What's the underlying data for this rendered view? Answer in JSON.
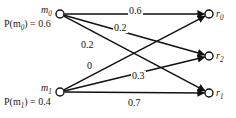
{
  "figure": {
    "type": "bipartite-channel-diagram",
    "ink_color": "#111111",
    "background": "#ffffff"
  },
  "inputs": [
    {
      "id": "m0",
      "label": "m",
      "subscript": "0",
      "prob_label": "P(m",
      "prob_subscript": "0",
      "prob_value": ") = 0.6",
      "prob_full": "P(m0) = 0.6",
      "x": 60,
      "y": 14
    },
    {
      "id": "m1",
      "label": "m",
      "subscript": "1",
      "prob_label": "P(m",
      "prob_subscript": "1",
      "prob_value": ") = 0.4",
      "prob_full": "P(m1) = 0.4",
      "x": 60,
      "y": 92
    }
  ],
  "outputs": [
    {
      "id": "r0",
      "label": "r",
      "subscript": "0",
      "x": 209,
      "y": 14
    },
    {
      "id": "r2",
      "label": "r",
      "subscript": "2",
      "x": 209,
      "y": 56
    },
    {
      "id": "r1",
      "label": "r",
      "subscript": "1",
      "x": 209,
      "y": 93
    }
  ],
  "edges": [
    {
      "from": "m0",
      "to": "r0",
      "label": "0.6",
      "lx": 128,
      "ly": 7
    },
    {
      "from": "m0",
      "to": "r2",
      "label": "0.2",
      "lx": 113,
      "ly": 24
    },
    {
      "from": "m0",
      "to": "r1",
      "label": "0.2",
      "lx": 80,
      "ly": 41
    },
    {
      "from": "m1",
      "to": "r0",
      "label": "0",
      "lx": 86,
      "ly": 62
    },
    {
      "from": "m1",
      "to": "r2",
      "label": "0.3",
      "lx": 131,
      "ly": 72
    },
    {
      "from": "m1",
      "to": "r1",
      "label": "0.7",
      "lx": 127,
      "ly": 99
    }
  ],
  "chart_data": {
    "type": "diagram",
    "title": "",
    "input_priors": {
      "m0": 0.6,
      "m1": 0.4
    },
    "transition_matrix": {
      "rows": [
        "m0",
        "m1"
      ],
      "columns": [
        "r0",
        "r2",
        "r1"
      ],
      "values": [
        [
          0.6,
          0.2,
          0.2
        ],
        [
          0.0,
          0.3,
          0.7
        ]
      ]
    }
  }
}
